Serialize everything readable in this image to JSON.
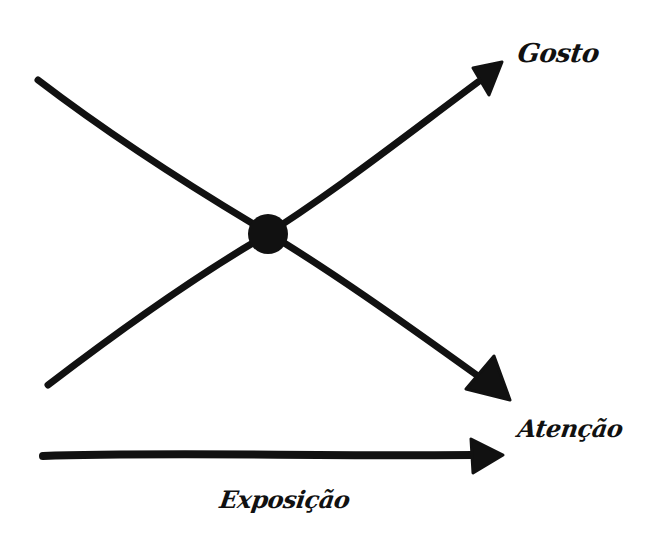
{
  "diagram": {
    "type": "hand-drawn crossing-arrows diagram",
    "stroke_color": "#111111",
    "background_color": "#ffffff",
    "labels": {
      "rising_line": "Gosto",
      "falling_line": "Atenção",
      "horizontal_axis": "Exposição"
    },
    "elements": [
      {
        "id": "rising-arrow",
        "label": "Gosto",
        "from": [
          48,
          385
        ],
        "to": [
          502,
          62
        ],
        "direction": "up-right"
      },
      {
        "id": "falling-arrow",
        "label": "Atenção",
        "from": [
          38,
          80
        ],
        "to": [
          510,
          400
        ],
        "direction": "down-right"
      },
      {
        "id": "axis-arrow",
        "label": "Exposição",
        "from": [
          43,
          456
        ],
        "to": [
          503,
          455
        ],
        "direction": "right"
      },
      {
        "id": "intersection-dot",
        "center": [
          268,
          234
        ],
        "radius": 20
      }
    ]
  }
}
